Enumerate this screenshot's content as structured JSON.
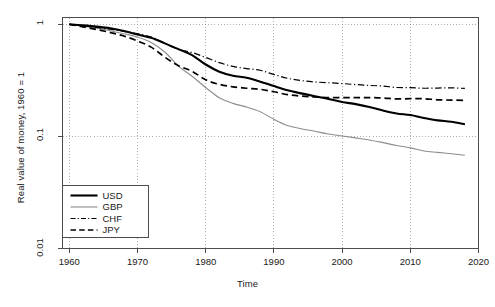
{
  "chart_data": {
    "type": "line",
    "title": "",
    "xlabel": "Time",
    "ylabel": "Real value of money, 1960 = 1",
    "xlim": [
      1959,
      2020
    ],
    "ylim": [
      0.01,
      1.15
    ],
    "yscale": "log",
    "grid": true,
    "grid_style": "dotted",
    "legend_position": "bottom-left",
    "xticks": [
      1960,
      1970,
      1980,
      1990,
      2000,
      2010,
      2020
    ],
    "xtick_labels": [
      "1960",
      "1970",
      "1980",
      "1990",
      "2000",
      "2010",
      "2020"
    ],
    "yticks": [
      1,
      0.1,
      0.01
    ],
    "ytick_labels": [
      "1",
      "0.1",
      "0.01"
    ],
    "x": [
      1960,
      1962,
      1964,
      1966,
      1968,
      1970,
      1972,
      1974,
      1976,
      1978,
      1980,
      1982,
      1984,
      1986,
      1988,
      1990,
      1992,
      1994,
      1996,
      1998,
      2000,
      2002,
      2004,
      2006,
      2008,
      2010,
      2012,
      2014,
      2016,
      2018
    ],
    "series": [
      {
        "name": "USD",
        "label": "USD",
        "color": "#000000",
        "line_style": "solid",
        "line_width": 2.1,
        "values": [
          1.0,
          0.978,
          0.953,
          0.922,
          0.873,
          0.811,
          0.758,
          0.676,
          0.601,
          0.531,
          0.438,
          0.378,
          0.348,
          0.333,
          0.308,
          0.281,
          0.258,
          0.242,
          0.228,
          0.216,
          0.203,
          0.194,
          0.183,
          0.17,
          0.16,
          0.155,
          0.146,
          0.139,
          0.135,
          0.128
        ]
      },
      {
        "name": "GBP",
        "label": "GBP",
        "color": "#8c8c8c",
        "line_style": "solid",
        "line_width": 1.1,
        "values": [
          1.0,
          0.963,
          0.925,
          0.876,
          0.823,
          0.768,
          0.688,
          0.566,
          0.424,
          0.344,
          0.273,
          0.221,
          0.197,
          0.183,
          0.166,
          0.142,
          0.125,
          0.117,
          0.111,
          0.105,
          0.101,
          0.097,
          0.093,
          0.088,
          0.083,
          0.079,
          0.074,
          0.072,
          0.07,
          0.068
        ]
      },
      {
        "name": "CHF",
        "label": "CHF",
        "color": "#000000",
        "line_style": "dashdot",
        "line_width": 1.2,
        "values": [
          1.0,
          0.968,
          0.94,
          0.903,
          0.866,
          0.825,
          0.769,
          0.676,
          0.598,
          0.56,
          0.506,
          0.455,
          0.421,
          0.403,
          0.389,
          0.357,
          0.33,
          0.315,
          0.306,
          0.301,
          0.296,
          0.29,
          0.285,
          0.281,
          0.273,
          0.272,
          0.269,
          0.27,
          0.271,
          0.268
        ]
      },
      {
        "name": "JPY",
        "label": "JPY",
        "color": "#000000",
        "line_style": "dashed",
        "line_width": 1.7,
        "values": [
          1.0,
          0.948,
          0.898,
          0.845,
          0.786,
          0.71,
          0.626,
          0.509,
          0.427,
          0.381,
          0.32,
          0.291,
          0.277,
          0.269,
          0.263,
          0.25,
          0.236,
          0.229,
          0.225,
          0.222,
          0.222,
          0.222,
          0.222,
          0.22,
          0.216,
          0.217,
          0.217,
          0.212,
          0.211,
          0.209
        ]
      }
    ],
    "legend_entries": [
      {
        "label": "USD",
        "style": "solid-thick"
      },
      {
        "label": "GBP",
        "style": "solid-thin-gray"
      },
      {
        "label": "CHF",
        "style": "dashdot"
      },
      {
        "label": "JPY",
        "style": "dashed"
      }
    ]
  },
  "colors": {
    "frame": "#4d4d4d",
    "grid": "#9a9a9a",
    "text": "#1a1a1a",
    "usd": "#000000",
    "gbp": "#8c8c8c",
    "chf": "#000000",
    "jpy": "#000000"
  }
}
